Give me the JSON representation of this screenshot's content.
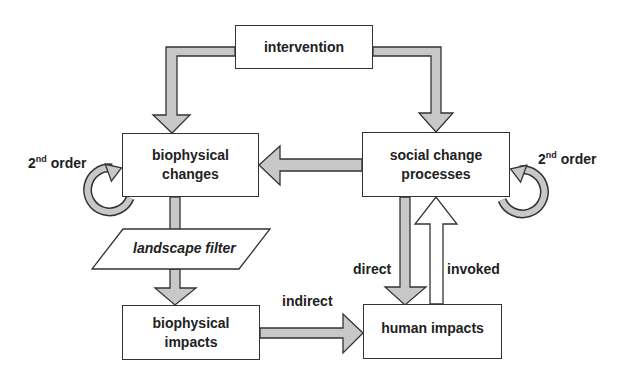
{
  "nodes": {
    "intervention": "intervention",
    "biophysical_changes": "biophysical changes",
    "social_change_processes": "social change processes",
    "landscape_filter": "landscape filter",
    "biophysical_impacts": "biophysical impacts",
    "human_impacts": "human impacts"
  },
  "labels": {
    "second_order_left_num": "2",
    "second_order_left_sup": "nd",
    "second_order_left_word": "order",
    "second_order_right_num": "2",
    "second_order_right_sup": "nd",
    "second_order_right_word": "order",
    "direct": "direct",
    "invoked": "invoked",
    "indirect": "indirect"
  },
  "colors": {
    "arrow_fill": "#c8c8c8",
    "stroke": "#333333",
    "background": "#ffffff"
  }
}
